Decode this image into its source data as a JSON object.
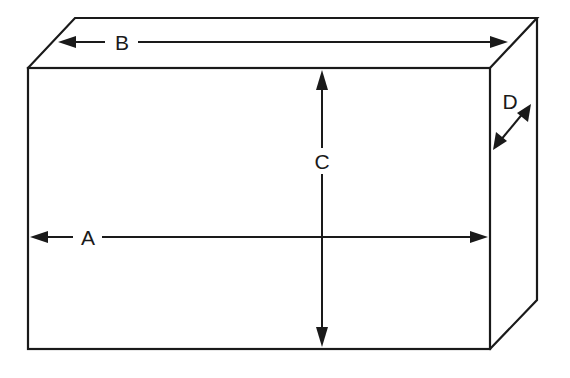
{
  "diagram": {
    "type": "rectangular-box-dimensions",
    "stroke_color": "#1a1a1a",
    "background": "#ffffff",
    "labels": {
      "A": "A",
      "B": "B",
      "C": "C",
      "D": "D"
    },
    "dimensions": [
      {
        "id": "A",
        "meaning": "front width",
        "orientation": "horizontal"
      },
      {
        "id": "B",
        "meaning": "top length",
        "orientation": "horizontal"
      },
      {
        "id": "C",
        "meaning": "height",
        "orientation": "vertical"
      },
      {
        "id": "D",
        "meaning": "depth",
        "orientation": "diagonal"
      }
    ]
  }
}
